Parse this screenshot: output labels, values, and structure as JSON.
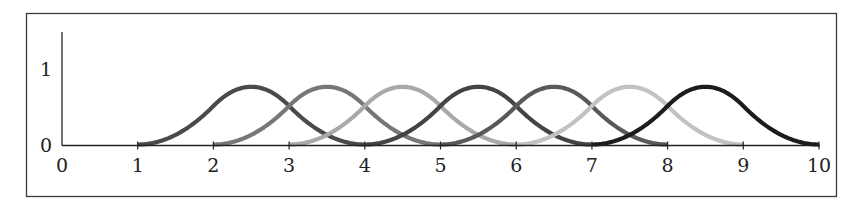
{
  "chart_data": {
    "type": "line",
    "title": "",
    "xlabel": "",
    "ylabel": "",
    "xlim": [
      0,
      10
    ],
    "ylim": [
      0,
      1
    ],
    "grid": false,
    "legend": null,
    "x_ticks": [
      "0",
      "1",
      "2",
      "3",
      "4",
      "5",
      "6",
      "7",
      "8",
      "9",
      "10"
    ],
    "y_ticks": [
      "0",
      "1"
    ],
    "series": [
      {
        "name": "B1",
        "support": [
          1,
          4
        ],
        "peak_x": 2.5,
        "peak_y": 0.75,
        "color": "#4a4a4a"
      },
      {
        "name": "B2",
        "support": [
          2,
          5
        ],
        "peak_x": 3.5,
        "peak_y": 0.75,
        "color": "#777777"
      },
      {
        "name": "B3",
        "support": [
          3,
          6
        ],
        "peak_x": 4.5,
        "peak_y": 0.75,
        "color": "#a9a9a9"
      },
      {
        "name": "B4",
        "support": [
          4,
          7
        ],
        "peak_x": 5.5,
        "peak_y": 0.75,
        "color": "#444444"
      },
      {
        "name": "B5",
        "support": [
          5,
          8
        ],
        "peak_x": 6.5,
        "peak_y": 0.75,
        "color": "#595959"
      },
      {
        "name": "B6",
        "support": [
          6,
          9
        ],
        "peak_x": 7.5,
        "peak_y": 0.75,
        "color": "#c2c2c2"
      },
      {
        "name": "B7",
        "support": [
          7,
          10
        ],
        "peak_x": 8.5,
        "peak_y": 0.75,
        "color": "#1c1c1c"
      }
    ]
  },
  "axes": {
    "x_labels": [
      "0",
      "1",
      "2",
      "3",
      "4",
      "5",
      "6",
      "7",
      "8",
      "9",
      "10"
    ],
    "y_labels": [
      "0",
      "1"
    ]
  }
}
